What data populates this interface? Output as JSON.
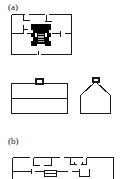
{
  "figure": {
    "caption_labels": [
      {
        "id": "a",
        "text": "(a)"
      },
      {
        "id": "b",
        "text": "(b)"
      }
    ],
    "background_color": "#ffffff",
    "line_color": "#1a1a1a",
    "fill_color": "#000000"
  },
  "panel_a": {
    "label": "(a)",
    "plan": {
      "name": "square-floor-plan",
      "outline": "rectangular building footprint",
      "central_core": "solid black cross / I-shaped masonry core",
      "interior_walls": "thin partition lines with door openings",
      "door_openings": 6
    },
    "elevation_left": {
      "name": "flat-roof-elevation",
      "shape": "rectangle with horizontal cornice band and small square cupola at top centre"
    },
    "elevation_right": {
      "name": "gable-roof-elevation",
      "shape": "pentagon house profile with small square cupola at apex"
    }
  },
  "panel_b": {
    "label": "(b)",
    "plan": {
      "name": "wide-floor-plan",
      "outline": "wide rectangular building footprint",
      "interior_walls": "thin partition lines with door openings and a central block",
      "door_openings": 8
    }
  }
}
